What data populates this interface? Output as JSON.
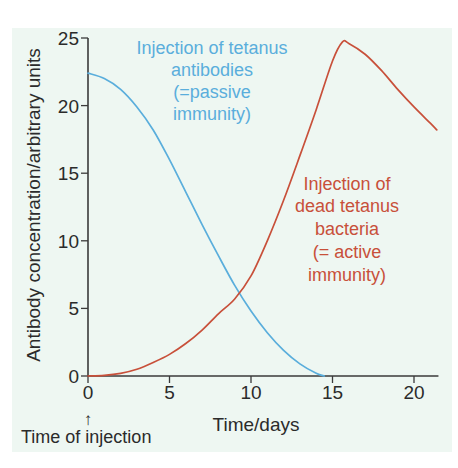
{
  "chart_data": {
    "type": "line",
    "title": "",
    "xlabel": "Time/days",
    "ylabel": "Antibody concentration/arbitrary units",
    "xlim": [
      0,
      21.5
    ],
    "ylim": [
      0,
      25
    ],
    "x_ticks": [
      0,
      5,
      10,
      15,
      20
    ],
    "y_ticks": [
      0,
      5,
      10,
      15,
      20,
      25
    ],
    "grid": false,
    "legend": "none (inline annotations)",
    "series": [
      {
        "name": "Injection of tetanus antibodies (=passive immunity)",
        "color": "#5aaedc",
        "x": [
          0,
          1,
          2,
          3,
          4,
          5,
          6,
          7,
          8,
          9,
          10,
          11,
          12,
          13,
          14,
          14.5
        ],
        "y": [
          22.4,
          22.0,
          21.2,
          19.9,
          18.2,
          16.0,
          13.6,
          11.2,
          8.9,
          6.7,
          4.8,
          3.2,
          1.9,
          0.9,
          0.2,
          0
        ]
      },
      {
        "name": "Injection of dead tetanus bacteria (= active immunity)",
        "color": "#c8503a",
        "x": [
          0,
          1,
          2,
          3,
          4,
          5,
          6,
          7,
          8,
          9,
          10,
          11,
          12,
          13,
          14,
          15,
          15.6,
          16,
          17,
          18,
          19,
          20,
          21,
          21.4
        ],
        "y": [
          0,
          0.05,
          0.2,
          0.5,
          1.0,
          1.6,
          2.4,
          3.4,
          4.6,
          5.7,
          7.4,
          10.0,
          13.0,
          16.3,
          19.7,
          23.3,
          24.7,
          24.6,
          23.8,
          22.6,
          21.2,
          19.9,
          18.7,
          18.2
        ]
      }
    ],
    "annotations": [
      {
        "text": "Time of injection",
        "at_x": 0,
        "arrow": "up"
      }
    ]
  },
  "labels": {
    "ylabel": "Antibody concentration/arbitrary units",
    "xlabel": "Time/days",
    "time_of_injection": "Time of injection",
    "arrow_glyph": "↑",
    "passive": [
      "Injection of tetanus",
      "antibodies",
      "(=passive",
      "immunity)"
    ],
    "active": [
      "Injection of",
      "dead tetanus",
      "bacteria",
      "(= active",
      "immunity)"
    ]
  },
  "colors": {
    "passive": "#5aaedc",
    "active": "#c8503a",
    "axis": "#3a3a3a",
    "panel": "#eef7f2"
  }
}
